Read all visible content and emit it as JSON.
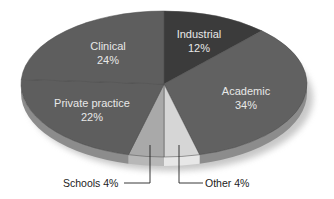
{
  "chart_data": {
    "type": "pie",
    "title": "",
    "style": "3d-tilted",
    "start_angle_deg": 0,
    "direction": "clockwise",
    "slices": [
      {
        "label": "Industrial",
        "value": 12,
        "display": "12%",
        "color": "#3b3b3b",
        "label_mode": "inside"
      },
      {
        "label": "Academic",
        "value": 34,
        "display": "34%",
        "color": "#616161",
        "label_mode": "inside"
      },
      {
        "label": "Other",
        "value": 4,
        "display": "Other 4%",
        "color": "#d6d6d6",
        "label_mode": "callout"
      },
      {
        "label": "Schools",
        "value": 4,
        "display": "Schools 4%",
        "color": "#a9a9a9",
        "label_mode": "callout"
      },
      {
        "label": "Private practice",
        "value": 22,
        "display": "22%",
        "color": "#5e5e5e",
        "label_mode": "inside"
      },
      {
        "label": "Clinical",
        "value": 24,
        "display": "24%",
        "color": "#5e5e5e",
        "label_mode": "inside"
      }
    ],
    "geometry": {
      "cx": 164,
      "cy": 84,
      "rx": 143,
      "ry": 73,
      "depth": 9
    },
    "rim_color": "#8c8c8c",
    "divider_color": "#4a4a4a",
    "legend": null
  },
  "labels": {
    "industrial": {
      "name": "Industrial",
      "pct": "12%",
      "x": 199,
      "y1": 38,
      "y2": 52
    },
    "academic": {
      "name": "Academic",
      "pct": "34%",
      "x": 246,
      "y1": 95,
      "y2": 109
    },
    "clinical": {
      "name": "Clinical",
      "pct": "24%",
      "x": 108,
      "y1": 50,
      "y2": 64
    },
    "private": {
      "name": "Private practice",
      "pct": "22%",
      "x": 92,
      "y1": 107,
      "y2": 121
    },
    "schools": {
      "text": "Schools 4%",
      "x": 63,
      "y": 187,
      "line": [
        [
          124,
          183
        ],
        [
          150,
          183
        ],
        [
          150,
          145
        ]
      ]
    },
    "other": {
      "text": "Other 4%",
      "x": 205,
      "y": 187,
      "line": [
        [
          203,
          183
        ],
        [
          179,
          183
        ],
        [
          179,
          145
        ]
      ]
    }
  }
}
